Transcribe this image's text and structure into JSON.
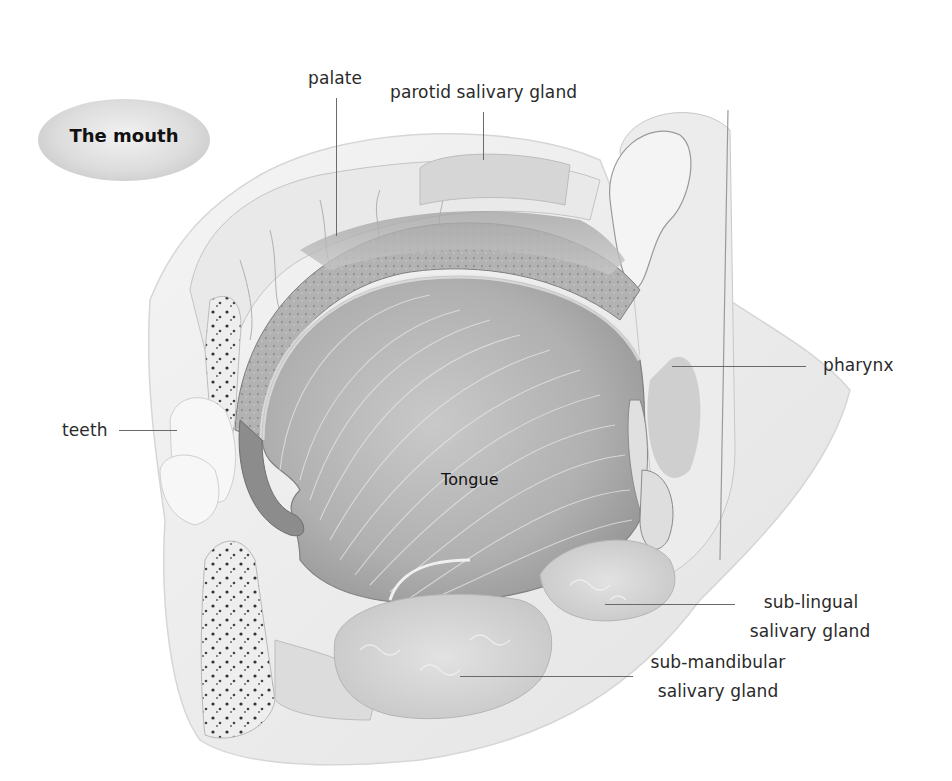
{
  "title": "The mouth",
  "labels": {
    "palate": "palate",
    "parotid": "parotid salivary gland",
    "pharynx": "pharynx",
    "teeth": "teeth",
    "tongue": "Tongue",
    "sublingual_line1": "sub-lingual",
    "sublingual_line2": "salivary gland",
    "submandibular_line1": "sub-mandibular",
    "submandibular_line2": "salivary gland"
  },
  "colors": {
    "background": "#ffffff",
    "title_pill": "#d4d4d4",
    "leader_line": "#6a6a6a",
    "tissue_light": "#e6e6e6",
    "tissue_mid": "#bdbdbd",
    "tissue_dark": "#8c8c8c"
  }
}
